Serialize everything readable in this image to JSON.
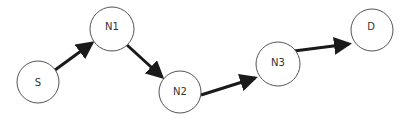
{
  "diagram": {
    "type": "directed-path-graph",
    "nodes": [
      {
        "id": "S",
        "label": "S",
        "x": 38,
        "y": 82,
        "r": 21
      },
      {
        "id": "N1",
        "label": "N1",
        "x": 112,
        "y": 29,
        "r": 22
      },
      {
        "id": "N2",
        "label": "N2",
        "x": 180,
        "y": 92,
        "r": 21
      },
      {
        "id": "N3",
        "label": "N3",
        "x": 278,
        "y": 64,
        "r": 22
      },
      {
        "id": "D",
        "label": "D",
        "x": 372,
        "y": 30,
        "r": 21
      }
    ],
    "edges": [
      {
        "from": "S",
        "to": "N1"
      },
      {
        "from": "N1",
        "to": "N2"
      },
      {
        "from": "N2",
        "to": "N3"
      },
      {
        "from": "N3",
        "to": "D"
      }
    ],
    "colors": {
      "node_stroke": "#555555",
      "edge": "#1a1a1a",
      "background": "#ffffff"
    }
  }
}
